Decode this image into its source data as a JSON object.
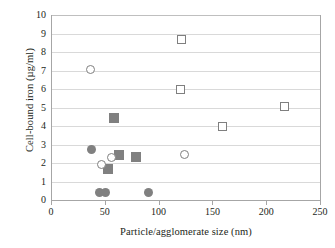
{
  "chart_data": {
    "type": "scatter",
    "title": "",
    "xlabel": "Particle/agglomerate size (nm)",
    "ylabel": "Cell-bound iron (µg/ml)",
    "xlim": [
      0,
      250
    ],
    "ylim": [
      0,
      10
    ],
    "xticks": [
      0,
      50,
      100,
      150,
      200,
      250
    ],
    "yticks": [
      0,
      1,
      2,
      3,
      4,
      5,
      6,
      7,
      8,
      9,
      10
    ],
    "xtick_labels": [
      "0",
      "50",
      "100",
      "150",
      "200",
      "250"
    ],
    "ytick_labels": [
      "0",
      "1",
      "2",
      "3",
      "4",
      "5",
      "6",
      "7",
      "8",
      "9",
      "10"
    ],
    "grid": "horizontal",
    "legend": "none",
    "marker_fill_color": "#808080",
    "marker_edge_color": "#7f7f7f",
    "gridline_color": "#d9d9d9",
    "axis_color": "#a6a6a6",
    "series": [
      {
        "name": "filled-circle",
        "marker": "filled-circle",
        "points": [
          {
            "x": 38,
            "y": 2.75
          },
          {
            "x": 45,
            "y": 0.42
          },
          {
            "x": 51,
            "y": 0.42
          },
          {
            "x": 91,
            "y": 0.42
          }
        ]
      },
      {
        "name": "filled-square",
        "marker": "filled-square",
        "points": [
          {
            "x": 59,
            "y": 4.45
          },
          {
            "x": 53,
            "y": 1.65
          },
          {
            "x": 63,
            "y": 2.45
          },
          {
            "x": 79,
            "y": 2.3
          }
        ]
      },
      {
        "name": "open-circle",
        "marker": "open-circle",
        "points": [
          {
            "x": 37,
            "y": 7.08
          },
          {
            "x": 47,
            "y": 1.9
          },
          {
            "x": 56,
            "y": 2.3
          },
          {
            "x": 124,
            "y": 2.45
          }
        ]
      },
      {
        "name": "open-square",
        "marker": "open-square",
        "points": [
          {
            "x": 121,
            "y": 8.7
          },
          {
            "x": 120,
            "y": 6.0
          },
          {
            "x": 159,
            "y": 3.97
          },
          {
            "x": 217,
            "y": 5.05
          }
        ]
      }
    ]
  }
}
